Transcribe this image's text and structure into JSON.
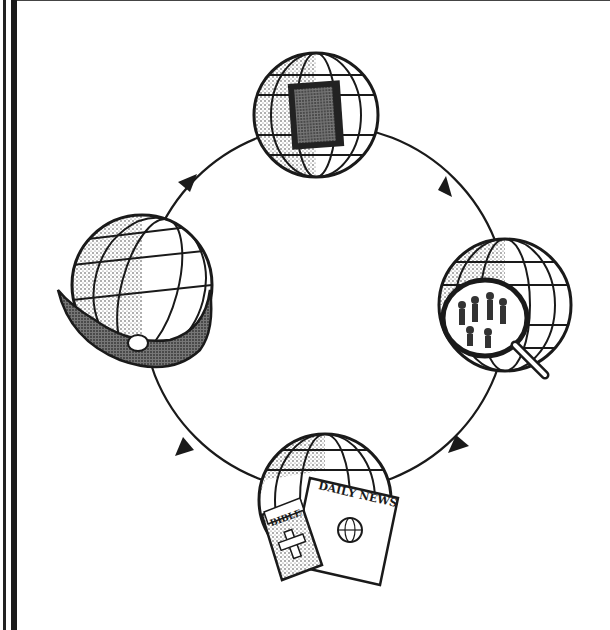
{
  "diagram": {
    "type": "cycle",
    "direction": "clockwise",
    "nodes": [
      {
        "id": "top",
        "name": "globe-with-bible",
        "description": "Globe with a closed book (Bible)"
      },
      {
        "id": "right",
        "name": "globe-with-magnifier",
        "description": "Globe viewed through a magnifying glass showing people"
      },
      {
        "id": "bottom",
        "name": "globe-with-bible-and-newspaper",
        "description": "Globe with a Bible and a newspaper"
      },
      {
        "id": "left",
        "name": "globe-in-hands",
        "description": "Globe held in cupped hands"
      }
    ],
    "labels": {
      "newspaper_title": "DAILY NEWS",
      "book_title": "BIBLE"
    },
    "colors": {
      "ink": "#1a1a1a",
      "background": "#ffffff"
    }
  }
}
